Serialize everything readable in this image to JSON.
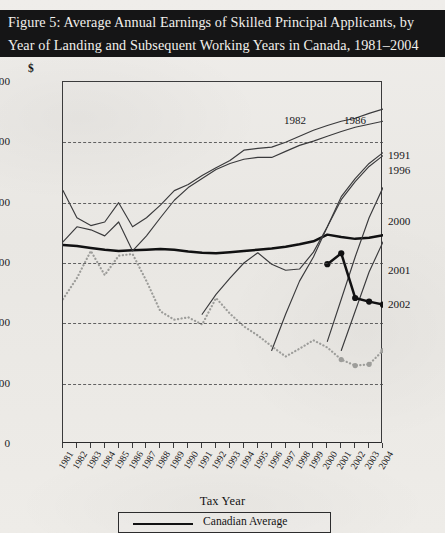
{
  "figure": {
    "title_line1": "Figure 5: Average Annual Earnings of Skilled Principal Applicants, by",
    "title_line2": "Year of Landing and Subsequent Working Years in Canada, 1981–2004"
  },
  "axes": {
    "y_unit": "$",
    "y_ticks": [
      "60,000",
      "50,000",
      "40,000",
      "30,000",
      "20,000",
      "10,000",
      "0"
    ],
    "x_title": "Tax Year",
    "x_ticks": [
      "1981",
      "1982",
      "1983",
      "1984",
      "1985",
      "1986",
      "1987",
      "1988",
      "1989",
      "1990",
      "1991",
      "1992",
      "1993",
      "1994",
      "1995",
      "1996",
      "1997",
      "1998",
      "1999",
      "2000",
      "2001",
      "2002",
      "2003",
      "2004"
    ]
  },
  "legend": {
    "items": [
      {
        "label": "Canadian Average",
        "style": "thick-solid-black",
        "color": "#111112"
      }
    ]
  },
  "inline_labels": [
    {
      "text": "1982",
      "x": 295,
      "y": 120
    },
    {
      "text": "1986",
      "x": 355,
      "y": 120
    }
  ],
  "right_labels": [
    {
      "text": "1991",
      "y": 155
    },
    {
      "text": "1996",
      "y": 170
    },
    {
      "text": "2000",
      "y": 221
    },
    {
      "text": "2001",
      "y": 270
    },
    {
      "text": "2002",
      "y": 304
    }
  ],
  "colors": {
    "banner_bg": "#151516",
    "banner_text": "#f2f0ec",
    "paper": "#eceae6",
    "axis": "#3b3b3c",
    "series_thin": "#3a3a3c",
    "series_thick": "#111112",
    "series_dotted": "#9d9d9a"
  },
  "chart_data": {
    "type": "line",
    "title": "Figure 5: Average Annual Earnings of Skilled Principal Applicants, by Year of Landing and Subsequent Working Years in Canada, 1981–2004",
    "xlabel": "Tax Year",
    "ylabel": "$",
    "x": [
      1981,
      1982,
      1983,
      1984,
      1985,
      1986,
      1987,
      1988,
      1989,
      1990,
      1991,
      1992,
      1993,
      1994,
      1995,
      1996,
      1997,
      1998,
      1999,
      2000,
      2001,
      2002,
      2003,
      2004
    ],
    "xlim": [
      1981,
      2004
    ],
    "ylim": [
      0,
      60000
    ],
    "yticks": [
      0,
      10000,
      20000,
      30000,
      40000,
      50000,
      60000
    ],
    "grid": "horizontal-dashed",
    "legend_position": "bottom",
    "series": [
      {
        "name": "Canadian Average",
        "label_position": "legend",
        "style": "thick-solid",
        "color": "#111112",
        "x": [
          1981,
          1982,
          1983,
          1984,
          1985,
          1986,
          1987,
          1988,
          1989,
          1990,
          1991,
          1992,
          1993,
          1994,
          1995,
          1996,
          1997,
          1998,
          1999,
          2000,
          2001,
          2002,
          2003,
          2004
        ],
        "values": [
          33000,
          32800,
          32500,
          32200,
          32000,
          32100,
          32200,
          32300,
          32200,
          31900,
          31700,
          31600,
          31800,
          32000,
          32200,
          32400,
          32700,
          33100,
          33600,
          34700,
          34300,
          34000,
          34200,
          34600
        ]
      },
      {
        "name": "1982 cohort",
        "label_position": "inline",
        "style": "thin-solid",
        "color": "#3a3a3c",
        "x": [
          1981,
          1982,
          1983,
          1984,
          1985,
          1986,
          1987,
          1988,
          1989,
          1990,
          1991,
          1992,
          1993,
          1994,
          1995,
          1996,
          1997,
          1998,
          1999,
          2000,
          2001,
          2002,
          2003,
          2004
        ],
        "values": [
          42000,
          37500,
          36200,
          36800,
          40000,
          36000,
          37500,
          39600,
          42000,
          43000,
          44500,
          45800,
          47000,
          48700,
          49000,
          49200,
          50000,
          51000,
          52000,
          52800,
          53500,
          54000,
          54800,
          55500
        ]
      },
      {
        "name": "1986 cohort",
        "label_position": "inline",
        "style": "thin-solid",
        "color": "#3a3a3c",
        "x": [
          1981,
          1982,
          1983,
          1984,
          1985,
          1986,
          1987,
          1988,
          1989,
          1990,
          1991,
          1992,
          1993,
          1994,
          1995,
          1996,
          1997,
          1998,
          1999,
          2000,
          2001,
          2002,
          2003,
          2004
        ],
        "values": [
          33500,
          36000,
          35500,
          34500,
          36800,
          32000,
          34500,
          37500,
          40400,
          42500,
          44000,
          45500,
          46500,
          47200,
          47500,
          47500,
          48500,
          49500,
          50200,
          51000,
          51800,
          52500,
          53000,
          53500
        ]
      },
      {
        "name": "1991 cohort",
        "label_position": "right",
        "style": "thin-solid",
        "color": "#3a3a3c",
        "x": [
          1991,
          1992,
          1993,
          1994,
          1995,
          1996,
          1997,
          1998,
          1999,
          2000,
          2001,
          2002,
          2003,
          2004
        ],
        "values": [
          21500,
          24800,
          27500,
          30000,
          31700,
          29800,
          28800,
          29000,
          31800,
          36000,
          41000,
          44000,
          46500,
          48300
        ]
      },
      {
        "name": "1996 cohort",
        "label_position": "right",
        "style": "thin-solid",
        "color": "#3a3a3c",
        "x": [
          1996,
          1997,
          1998,
          1999,
          2000,
          2001,
          2002,
          2003,
          2004
        ],
        "values": [
          15500,
          21500,
          27000,
          31000,
          36000,
          40500,
          43500,
          46000,
          47800
        ]
      },
      {
        "name": "2000 cohort",
        "label_position": "right",
        "style": "thin-solid",
        "color": "#3a3a3c",
        "x": [
          2000,
          2001,
          2002,
          2003,
          2004
        ],
        "values": [
          17000,
          24000,
          31000,
          37500,
          42500
        ]
      },
      {
        "name": "2001 cohort",
        "label_position": "right",
        "style": "thin-solid",
        "color": "#3a3a3c",
        "x": [
          2001,
          2002,
          2003,
          2004
        ],
        "values": [
          15500,
          22000,
          28500,
          33500
        ]
      },
      {
        "name": "2002 cohort",
        "label_position": "right",
        "style": "thick-solid-markers",
        "color": "#111112",
        "x": [
          2000,
          2001,
          2002,
          2003,
          2004
        ],
        "values": [
          29800,
          31600,
          24200,
          23600,
          23100
        ]
      },
      {
        "name": "recent-entrant average",
        "label_position": "none",
        "style": "dotted",
        "color": "#9d9d9a",
        "x": [
          1981,
          1982,
          1983,
          1984,
          1985,
          1986,
          1987,
          1988,
          1989,
          1990,
          1991,
          1992,
          1993,
          1994,
          1995,
          1996,
          1997,
          1998,
          1999,
          2000,
          2001,
          2002,
          2003,
          2004
        ],
        "values": [
          24000,
          27500,
          32000,
          28000,
          31200,
          31500,
          27000,
          22000,
          20600,
          21000,
          19800,
          24200,
          21600,
          19500,
          18000,
          16200,
          14500,
          15800,
          17200,
          16000,
          14000,
          13000,
          13200,
          15500
        ]
      }
    ]
  }
}
